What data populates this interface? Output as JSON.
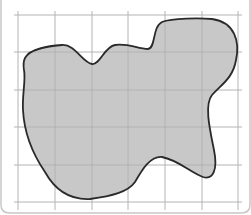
{
  "figure": {
    "grid": {
      "columns": 6,
      "rows": 5,
      "x_lines": [
        18,
        55,
        92,
        128,
        165,
        202,
        238
      ],
      "y_lines": [
        15,
        52,
        90,
        127,
        165,
        202
      ],
      "line_color": "#b4b4b4"
    },
    "shape": {
      "fill_color": "#c8c8c8",
      "fill_opacity": 0.85,
      "stroke_color": "#2a2a2a",
      "stroke_width": 1.8,
      "path": "M 25 58 C 30 48, 50 46, 62 45 C 75 44, 82 62, 92 64 C 100 65, 104 47, 115 45 C 128 43, 138 49, 148 49 C 156 48, 152 27, 162 22 C 172 18, 200 18, 212 19 C 235 22, 240 42, 236 60 C 233 78, 222 84, 212 95 C 204 105, 210 130, 214 150 C 218 170, 213 180, 203 177 C 190 172, 178 160, 162 157 C 150 156, 142 170, 135 182 C 128 192, 112 196, 90 199 C 70 200, 55 190, 45 172 C 30 150, 24 130, 23 110 C 22 95, 26 80, 24 70 C 23 64, 24 60, 25 58 Z"
    },
    "frame": {
      "border_color": "#c8c8c8",
      "corner_radius": 10
    }
  }
}
